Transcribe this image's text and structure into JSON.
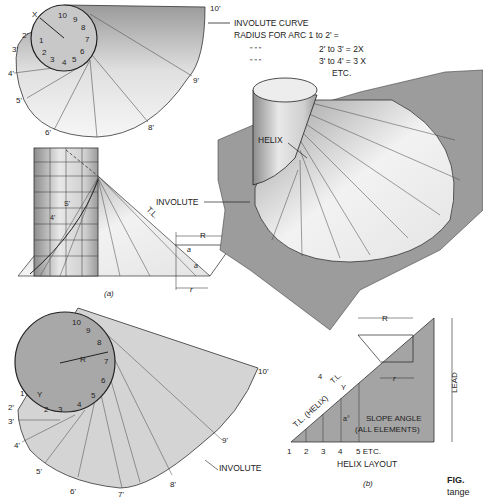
{
  "figure": {
    "caption_bold": "FIG. ",
    "caption_rest": "tange",
    "part_a_label": "(a)",
    "part_b_label": "(b)"
  },
  "top_involute": {
    "circle_numbers": [
      "1",
      "2",
      "3",
      "4",
      "5",
      "6",
      "7",
      "8",
      "9",
      "10"
    ],
    "primed_points": [
      "2'",
      "3'",
      "4'",
      "5'",
      "6'",
      "8'",
      "9'",
      "10'"
    ],
    "x_label": "X",
    "notes": {
      "line1": "INVOLUTE CURVE",
      "line2": "RADIUS FOR ARC 1 to 2' =",
      "line3_ditto": "\"        \"        \"",
      "line3": "2' to 3' = 2X",
      "line4_ditto": "\"        \"        \"",
      "line4": "3' to 4' = 3 X",
      "line5": "ETC."
    }
  },
  "cylinder_view": {
    "label_s": "S'",
    "label_4": "4'",
    "tl": "T.L.",
    "R": "R",
    "a": "a",
    "r": "r"
  },
  "pictorial": {
    "helix": "HELIX",
    "involute": "INVOLUTE"
  },
  "bottom_involute": {
    "circle_numbers": [
      "1",
      "2",
      "3",
      "4",
      "5",
      "6",
      "7",
      "8",
      "9",
      "10"
    ],
    "primed_points": [
      "2'",
      "3'",
      "4'",
      "5'",
      "6'",
      "7'",
      "8'",
      "9'",
      "10'"
    ],
    "R": "R",
    "Y": "Y",
    "involute": "INVOLUTE"
  },
  "helix_layout": {
    "title": "HELIX LAYOUT",
    "x_points": [
      "1",
      "2",
      "3",
      "4",
      "5 ETC."
    ],
    "tl_helix": "T.L. (HELIX)",
    "tl": "T.L.",
    "y": "Y",
    "four": "4",
    "a_deg": "a°",
    "slope_angle_1": "SLOPE ANGLE",
    "slope_angle_2": "(ALL ELEMENTS)",
    "lead": "LEAD",
    "R": "R",
    "r": "r"
  }
}
